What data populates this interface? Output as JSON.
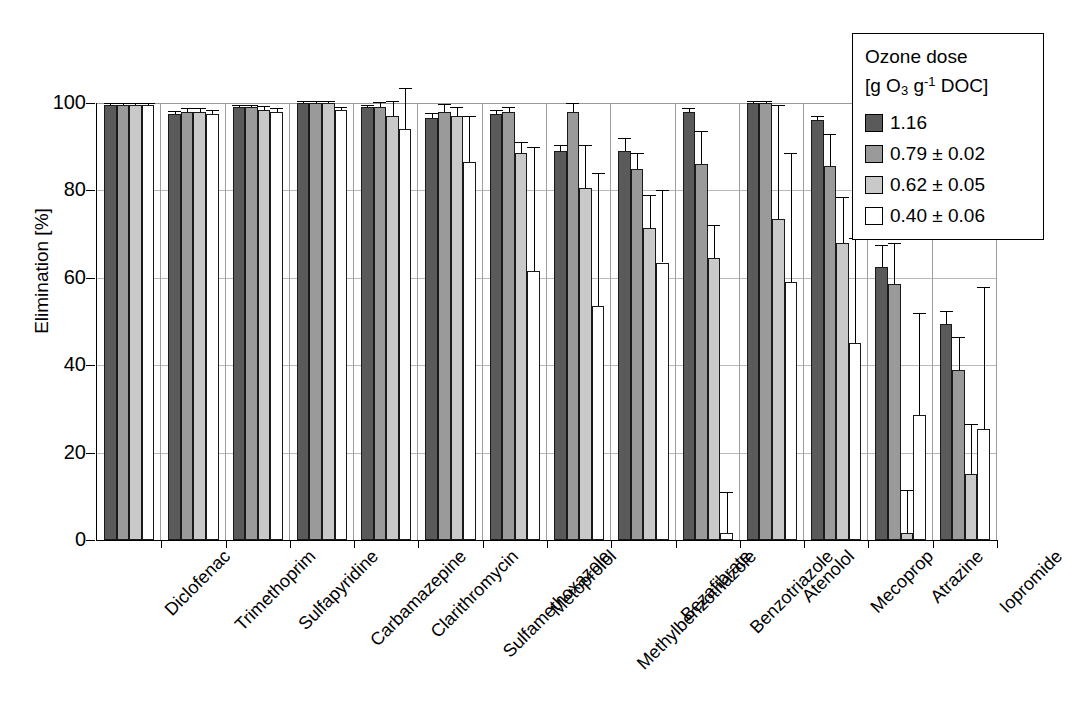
{
  "chart_data": {
    "type": "bar",
    "title": "",
    "xlabel": "",
    "ylabel": "Elimination [%]",
    "ylim": [
      0,
      100
    ],
    "yticks": [
      0,
      20,
      40,
      60,
      80,
      100
    ],
    "grid": "horizontal",
    "legend_position": "top-right",
    "legend_title_line1": "Ozone dose",
    "legend_title_line2": "[g O3 g-1 DOC]",
    "categories": [
      "Diclofenac",
      "Trimethoprim",
      "Sulfapyridine",
      "Carbamazepine",
      "Clarithromycin",
      "Sulfamethoxazole",
      "Metoprolol",
      "Methylbenzotriazole",
      "Bezafibrate",
      "Benzotriazole",
      "Atenolol",
      "Mecoprop",
      "Atrazine",
      "Iopromide"
    ],
    "series": [
      {
        "name": "1.16",
        "color": "#5a5a5a",
        "values": [
          99.5,
          97.5,
          99.0,
          100.0,
          99.0,
          96.5,
          97.5,
          89.0,
          89.0,
          98.0,
          100.0,
          96.0,
          62.5,
          49.5
        ],
        "errors": [
          0.5,
          0.7,
          0.5,
          0.4,
          0.6,
          1.2,
          0.8,
          1.5,
          3.0,
          0.8,
          0.4,
          1.0,
          5.0,
          3.0
        ]
      },
      {
        "name": "0.79 ± 0.02",
        "color": "#9a9a9a",
        "values": [
          99.5,
          98.0,
          99.0,
          100.0,
          99.0,
          98.0,
          98.0,
          98.0,
          85.0,
          86.0,
          100.0,
          85.5,
          58.5,
          39.0
        ],
        "errors": [
          0.5,
          0.8,
          0.6,
          0.4,
          1.2,
          1.8,
          1.0,
          2.0,
          3.5,
          7.5,
          0.4,
          7.5,
          9.5,
          7.5
        ]
      },
      {
        "name": "0.62 ± 0.05",
        "color": "#c9c9c9",
        "values": [
          99.5,
          98.0,
          98.5,
          100.0,
          97.0,
          97.0,
          88.5,
          80.5,
          71.5,
          64.5,
          73.5,
          68.0,
          1.5,
          15.0
        ],
        "errors": [
          0.5,
          0.9,
          0.8,
          0.4,
          3.5,
          2.0,
          2.5,
          10.0,
          7.5,
          7.5,
          26.0,
          10.5,
          10.0,
          11.5
        ]
      },
      {
        "name": "0.40 ± 0.06",
        "color": "#ffffff",
        "values": [
          99.5,
          97.5,
          98.0,
          98.5,
          94.0,
          86.5,
          61.5,
          53.5,
          63.5,
          1.5,
          59.0,
          45.0,
          28.5,
          25.5
        ],
        "errors": [
          0.6,
          1.0,
          0.8,
          0.6,
          9.5,
          10.5,
          28.5,
          30.5,
          16.5,
          9.5,
          29.5,
          24.0,
          23.5,
          32.5
        ]
      }
    ]
  }
}
